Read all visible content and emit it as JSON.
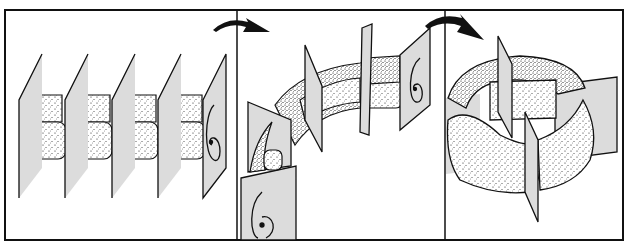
{
  "figure": {
    "panels": [
      {
        "id": "straight-tube",
        "step": 1,
        "planes": 5
      },
      {
        "id": "bending-tube",
        "step": 2,
        "planes": 4
      },
      {
        "id": "closed-torus",
        "step": 3,
        "planes": 3
      }
    ],
    "arrows": [
      {
        "from": "straight-tube",
        "to": "bending-tube"
      },
      {
        "from": "bending-tube",
        "to": "closed-torus"
      }
    ],
    "colors": {
      "ink": "#111111",
      "plane_fill": "#d9d9d9",
      "background": "#ffffff"
    }
  }
}
